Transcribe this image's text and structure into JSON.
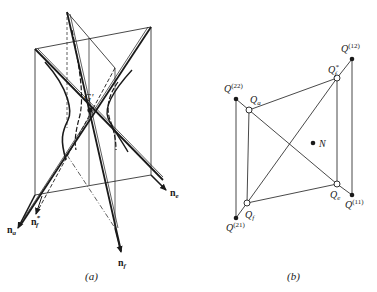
{
  "panel_a": {
    "caption": "(a)",
    "point_label": "G'",
    "vectors": {
      "n_a": {
        "base": "n",
        "sub": "a"
      },
      "n_f_star": {
        "base": "n",
        "sub": "f",
        "sup": "*"
      },
      "n_f": {
        "base": "n",
        "sub": "f"
      },
      "n_e": {
        "base": "n",
        "sub": "e"
      }
    }
  },
  "panel_b": {
    "caption": "(b)",
    "points": {
      "Q22": {
        "base": "Q",
        "sup": "(22)"
      },
      "Q12": {
        "base": "Q",
        "sup": "(12)"
      },
      "Q21": {
        "base": "Q",
        "sup": "(21)"
      },
      "Q11": {
        "base": "Q",
        "sup": "(11)"
      },
      "Qa": {
        "base": "Q",
        "sub": "a"
      },
      "Qf_star": {
        "base": "Q",
        "sub": "f",
        "sup": "*"
      },
      "Qf": {
        "base": "Q",
        "sub": "f"
      },
      "Qe": {
        "base": "Q",
        "sub": "e"
      },
      "N": {
        "base": "N"
      }
    }
  },
  "colors": {
    "ink": "#1a1a1a",
    "background": "#ffffff"
  }
}
